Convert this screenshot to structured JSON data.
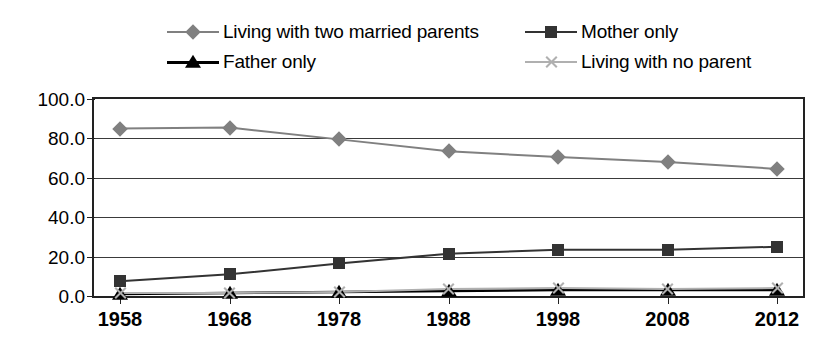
{
  "chart_data": {
    "type": "line",
    "title": "",
    "xlabel": "",
    "ylabel": "",
    "categories": [
      "1958",
      "1968",
      "1978",
      "1988",
      "1998",
      "2008",
      "2012"
    ],
    "ylim": [
      0.0,
      100.0
    ],
    "yticks": [
      "0.0",
      "20.0",
      "40.0",
      "60.0",
      "80.0",
      "100.0"
    ],
    "ytick_values": [
      0.0,
      20.0,
      40.0,
      60.0,
      80.0,
      100.0
    ],
    "grid": true,
    "legend_position": "top",
    "series": [
      {
        "name": "Living with two married parents",
        "marker": "diamond",
        "color": "#808080",
        "values": [
          85.0,
          85.5,
          79.5,
          73.5,
          70.5,
          68.0,
          64.5
        ]
      },
      {
        "name": "Mother only",
        "marker": "square",
        "color": "#333333",
        "values": [
          7.5,
          11.0,
          16.5,
          21.5,
          23.5,
          23.5,
          25.0
        ]
      },
      {
        "name": "Father only",
        "marker": "triangle",
        "color": "#000000",
        "values": [
          1.0,
          1.5,
          2.0,
          2.5,
          3.0,
          3.0,
          3.0
        ]
      },
      {
        "name": "Living with no parent",
        "marker": "x",
        "color": "#b0b0b0",
        "values": [
          1.5,
          1.5,
          2.0,
          3.5,
          4.0,
          3.5,
          4.0
        ]
      }
    ]
  },
  "legend": {
    "items": [
      {
        "label": "Living with two married parents",
        "marker": "diamond",
        "color": "#808080"
      },
      {
        "label": "Mother only",
        "marker": "square",
        "color": "#333333"
      },
      {
        "label": "Father only",
        "marker": "triangle",
        "color": "#000000"
      },
      {
        "label": "Living with no parent",
        "marker": "x",
        "color": "#b0b0b0"
      }
    ]
  }
}
